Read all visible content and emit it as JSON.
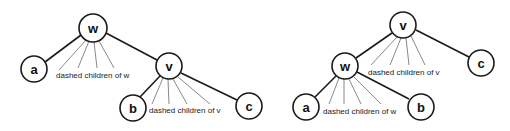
{
  "diagram": {
    "type": "tree-rotation",
    "left_tree": {
      "nodes": [
        {
          "id": "w",
          "label": "w",
          "x": 93,
          "y": 28
        },
        {
          "id": "a",
          "label": "a",
          "x": 34,
          "y": 69
        },
        {
          "id": "v",
          "label": "v",
          "x": 169,
          "y": 66
        },
        {
          "id": "b",
          "label": "b",
          "x": 133,
          "y": 108
        },
        {
          "id": "c",
          "label": "c",
          "x": 249,
          "y": 106
        }
      ],
      "edges": [
        [
          "w",
          "a"
        ],
        [
          "w",
          "v"
        ],
        [
          "v",
          "b"
        ],
        [
          "v",
          "c"
        ]
      ],
      "fans": [
        {
          "parent": "w",
          "label": "dashed children of w"
        },
        {
          "parent": "v",
          "label": "dashed children of v"
        }
      ]
    },
    "right_tree": {
      "nodes": [
        {
          "id": "v",
          "label": "v",
          "x": 403,
          "y": 25
        },
        {
          "id": "w",
          "label": "w",
          "x": 345,
          "y": 66
        },
        {
          "id": "c",
          "label": "c",
          "x": 481,
          "y": 63
        },
        {
          "id": "a",
          "label": "a",
          "x": 306,
          "y": 107
        },
        {
          "id": "b",
          "label": "b",
          "x": 421,
          "y": 107
        }
      ],
      "edges": [
        [
          "v",
          "w"
        ],
        [
          "v",
          "c"
        ],
        [
          "w",
          "a"
        ],
        [
          "w",
          "b"
        ]
      ],
      "fans": [
        {
          "parent": "v",
          "label": "dashed children of v"
        },
        {
          "parent": "w",
          "label": "dashed children of w"
        }
      ]
    }
  },
  "labels": {
    "left_w": "w",
    "left_a": "a",
    "left_v": "v",
    "left_b": "b",
    "left_c": "c",
    "left_fan_w": "dashed children of w",
    "left_fan_v": "dashed children of v",
    "right_v": "v",
    "right_w": "w",
    "right_c": "c",
    "right_a": "a",
    "right_b": "b",
    "right_fan_v": "dashed children of v",
    "right_fan_w": "dashed children of w"
  },
  "colors": {
    "stroke": "#1a1a1a",
    "fan_stroke": "#6a6a6a",
    "background": "#ffffff"
  }
}
